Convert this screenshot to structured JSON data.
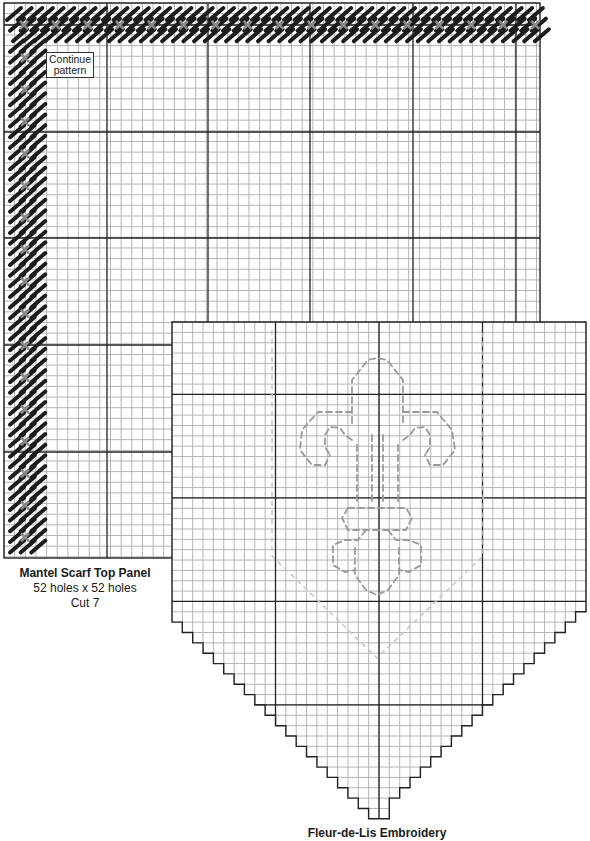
{
  "top_panel": {
    "title": "Mantel Scarf Top Panel",
    "size_text": "52 holes x 52 holes",
    "cut_text": "Cut 7",
    "note": "Continue pattern",
    "holes_wide": 52,
    "holes_high": 52,
    "border_stitch": "slanted-continental",
    "border_accent": "cross-stitch"
  },
  "bottom_panel": {
    "title": "Fleur-de-Lis Embroidery",
    "motif": "fleur-de-lis",
    "columns": 40,
    "shape": "pennant",
    "outline_style": "dashed"
  },
  "colors": {
    "grid_fine": "#b5b5b5",
    "grid_heavy": "#222222",
    "stitch_dark": "#1c1c1c",
    "stitch_cross": "#8a8a8a",
    "motif_dashed": "#9a9a9a",
    "pennant_dashed": "#c8c8c8"
  }
}
